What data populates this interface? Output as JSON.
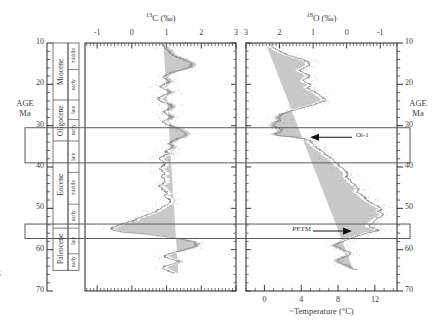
{
  "figure": {
    "kind": "paleoclimate-isotope-stack",
    "left_panel": {
      "title_iso": "13",
      "title_el": "C",
      "title_unit": "(‰)",
      "title_full": "13C (‰)",
      "x_ticks": [
        "-1",
        "0",
        "1",
        "2",
        "3"
      ],
      "x_tick_values": [
        -1,
        0,
        1,
        2,
        3
      ],
      "x_min": -1.35,
      "x_max": 3.0,
      "x_reversed": false
    },
    "right_panel": {
      "title_iso": "18",
      "title_el": "O",
      "title_unit": "(‰)",
      "title_full": "18O (‰)",
      "x_ticks": [
        "3",
        "2",
        "1",
        "0",
        "-1"
      ],
      "x_tick_values": [
        3,
        2,
        1,
        0,
        -1
      ],
      "x_min": 3.0,
      "x_max": -1.5,
      "x_reversed": true,
      "secondary_axis": {
        "label_prefix": "~",
        "label": "Temperature (°C)",
        "label_full": "~Temperature (°C)",
        "ticks": [
          "0",
          "4",
          "8",
          "12"
        ],
        "tick_values": [
          0,
          4,
          8,
          12
        ],
        "min": -2.0,
        "max": 14.4
      }
    },
    "age_axis": {
      "label_line1": "AGE",
      "label_line2": "Ma",
      "ticks": [
        "10",
        "20",
        "30",
        "40",
        "50",
        "60",
        "70"
      ],
      "tick_values": [
        10,
        20,
        30,
        40,
        50,
        60,
        70
      ],
      "minor_step": 2,
      "min": 10,
      "max": 70,
      "left_label_line1": "AGE",
      "left_label_line2": "Ma",
      "right_label_line1": "AGE",
      "right_label_line2": "Ma"
    },
    "epochs": [
      {
        "name": "Miocene",
        "top": 10,
        "bottom": 23.8
      },
      {
        "name": "Oligocene",
        "top": 23.8,
        "bottom": 33.7
      },
      {
        "name": "Eocene",
        "top": 33.7,
        "bottom": 54.8
      },
      {
        "name": "Paleocene",
        "top": 54.8,
        "bottom": 65.0
      }
    ],
    "stages": [
      {
        "name": "middle",
        "top": 10.0,
        "bottom": 16.4
      },
      {
        "name": "early",
        "top": 16.4,
        "bottom": 23.8
      },
      {
        "name": "late",
        "top": 23.8,
        "bottom": 28.5
      },
      {
        "name": "early",
        "top": 28.5,
        "bottom": 33.7
      },
      {
        "name": "late",
        "top": 33.7,
        "bottom": 41.3
      },
      {
        "name": "middle",
        "top": 41.3,
        "bottom": 49.0
      },
      {
        "name": "early",
        "top": 49.0,
        "bottom": 54.8
      },
      {
        "name": "late",
        "top": 54.8,
        "bottom": 61.0
      },
      {
        "name": "early",
        "top": 61.0,
        "bottom": 65.0
      }
    ],
    "highlight_boxes": [
      {
        "name": "oi-1-interval",
        "top": 30.5,
        "bottom": 39.0
      },
      {
        "name": "petm-interval",
        "top": 53.8,
        "bottom": 57.3
      }
    ],
    "annotations": [
      {
        "id": "oi-1",
        "text": "Oi-1",
        "age": 32.8,
        "arrow": "left"
      },
      {
        "id": "petm",
        "text": "PETM",
        "age": 55.5,
        "arrow": "right"
      }
    ],
    "colors": {
      "ink": "#3a3a3a",
      "frame": "#555555",
      "data_line": "#7a7a7a",
      "data_band": "#b4b4b4",
      "highlight_stroke": "#5a5a5a",
      "background": "#ffffff"
    }
  },
  "chart_data": {
    "type": "line",
    "xlabel": "",
    "ylabel": "AGE Ma",
    "ylim": [
      70,
      10
    ],
    "grid": false,
    "legend": "none",
    "panels": [
      {
        "name": "d13C",
        "title": "13C (‰)",
        "xlabel": "13C (‰)",
        "xlim": [
          -1.35,
          3.0
        ],
        "xticks": [
          -1,
          0,
          1,
          2,
          3
        ],
        "x_reversed": false,
        "series": [
          {
            "name": "δ13C smoothed",
            "age": [
              10.0,
              10.6,
              11.2,
              11.8,
              12.4,
              13.0,
              13.6,
              14.2,
              14.8,
              15.4,
              16.0,
              16.5,
              17.0,
              17.6,
              18.2,
              18.8,
              19.4,
              20.0,
              20.6,
              21.2,
              21.8,
              22.4,
              23.0,
              23.6,
              24.2,
              24.8,
              25.4,
              26.0,
              26.6,
              27.2,
              27.8,
              28.4,
              29.0,
              29.6,
              30.2,
              30.8,
              31.4,
              32.0,
              32.6,
              33.2,
              33.8,
              34.4,
              35.0,
              35.6,
              36.2,
              36.8,
              37.4,
              38.0,
              38.6,
              39.2,
              39.8,
              40.4,
              41.0,
              41.6,
              42.2,
              42.8,
              43.4,
              44.0,
              44.6,
              45.2,
              45.8,
              46.4,
              47.0,
              47.6,
              48.2,
              48.8,
              49.4,
              50.0,
              50.6,
              51.2,
              51.8,
              52.4,
              53.0,
              53.4,
              53.8,
              54.2,
              54.6,
              55.0,
              55.4,
              55.8,
              56.2,
              56.8,
              57.4,
              58.0,
              58.6,
              59.2,
              59.8,
              60.4,
              61.0,
              61.6,
              62.2,
              62.8,
              63.4,
              64.0,
              64.6,
              65.2,
              65.8,
              66.2
            ],
            "values": [
              0.8,
              0.88,
              0.95,
              1.05,
              1.1,
              1.18,
              1.35,
              1.55,
              1.7,
              1.72,
              1.6,
              1.42,
              1.18,
              1.0,
              0.92,
              1.0,
              1.08,
              0.92,
              0.8,
              0.95,
              1.12,
              1.0,
              0.82,
              0.72,
              0.88,
              1.05,
              1.18,
              1.05,
              0.9,
              1.0,
              1.15,
              1.05,
              0.88,
              1.0,
              1.18,
              1.35,
              1.48,
              1.55,
              1.48,
              1.3,
              1.15,
              1.05,
              1.2,
              1.1,
              0.95,
              1.08,
              0.9,
              0.78,
              0.88,
              0.98,
              0.88,
              0.78,
              0.88,
              0.95,
              0.85,
              0.9,
              0.98,
              0.88,
              0.8,
              0.88,
              0.95,
              1.02,
              0.95,
              1.05,
              1.12,
              1.05,
              0.95,
              0.85,
              0.72,
              0.55,
              0.35,
              0.18,
              0.05,
              -0.1,
              -0.3,
              -0.45,
              -0.55,
              -0.6,
              -0.5,
              -0.2,
              0.35,
              0.95,
              1.4,
              1.72,
              1.85,
              1.8,
              1.62,
              1.35,
              1.05,
              0.92,
              1.1,
              1.35,
              1.2,
              0.95,
              0.88,
              1.05,
              1.25
            ]
          }
        ]
      },
      {
        "name": "d18O",
        "title": "18O (‰)",
        "xlabel": "18O (‰)",
        "xlim": [
          3.0,
          -1.5
        ],
        "xticks": [
          3,
          2,
          1,
          0,
          -1
        ],
        "x_reversed": true,
        "secondary_xlabel": "~Temperature (°C)",
        "secondary_xticks": [
          0,
          4,
          8,
          12
        ],
        "series": [
          {
            "name": "δ18O smoothed",
            "age": [
              10.0,
              10.6,
              11.2,
              11.8,
              12.4,
              13.0,
              13.6,
              14.2,
              14.8,
              15.4,
              16.0,
              16.6,
              17.2,
              17.8,
              18.4,
              19.0,
              19.6,
              20.2,
              20.8,
              21.4,
              22.0,
              22.6,
              23.2,
              23.8,
              24.4,
              25.0,
              25.6,
              26.2,
              26.8,
              27.4,
              28.0,
              28.6,
              29.2,
              29.8,
              30.4,
              31.0,
              31.6,
              32.0,
              32.4,
              32.8,
              33.2,
              33.6,
              34.0,
              34.6,
              35.2,
              35.8,
              36.4,
              37.0,
              37.6,
              38.2,
              38.8,
              39.4,
              40.0,
              40.6,
              41.2,
              41.8,
              42.4,
              43.0,
              43.6,
              44.2,
              44.8,
              45.4,
              46.0,
              46.6,
              47.2,
              47.8,
              48.4,
              49.0,
              49.6,
              50.2,
              50.8,
              51.4,
              52.0,
              52.6,
              53.2,
              53.8,
              54.2,
              54.6,
              55.0,
              55.3,
              55.6,
              56.0,
              56.6,
              57.2,
              57.8,
              58.4,
              59.0,
              59.6,
              60.2,
              60.8,
              61.4,
              62.0,
              62.6,
              63.2,
              63.8,
              64.4,
              65.0,
              65.6
            ],
            "values": [
              2.3,
              2.25,
              2.15,
              2.05,
              1.9,
              1.7,
              1.45,
              1.25,
              1.12,
              1.1,
              1.25,
              1.4,
              1.28,
              1.1,
              1.15,
              1.3,
              1.2,
              1.05,
              1.18,
              1.05,
              0.92,
              0.8,
              0.72,
              0.62,
              0.8,
              1.0,
              1.25,
              1.55,
              1.8,
              1.95,
              2.05,
              1.95,
              2.1,
              2.2,
              2.1,
              1.95,
              2.0,
              2.15,
              2.05,
              1.55,
              1.25,
              1.1,
              1.05,
              1.0,
              0.92,
              0.8,
              0.72,
              0.62,
              0.52,
              0.42,
              0.35,
              0.25,
              0.18,
              0.1,
              0.02,
              -0.05,
              0.02,
              -0.08,
              -0.15,
              -0.22,
              -0.3,
              -0.38,
              -0.3,
              -0.42,
              -0.5,
              -0.58,
              -0.68,
              -0.82,
              -0.95,
              -1.05,
              -0.95,
              -1.1,
              -1.0,
              -0.88,
              -0.8,
              -0.72,
              -0.65,
              -0.72,
              -0.85,
              -1.0,
              -0.85,
              -0.6,
              -0.35,
              -0.15,
              0.05,
              0.22,
              0.35,
              0.22,
              0.05,
              -0.12,
              -0.05,
              0.15,
              0.3,
              0.18,
              0.0,
              -0.15,
              -0.3
            ]
          }
        ]
      }
    ],
    "annotations": [
      {
        "text": "Oi-1",
        "panel": "d18O",
        "age": 32.8
      },
      {
        "text": "PETM",
        "panel": "d18O",
        "age": 55.5
      }
    ],
    "epoch_column": [
      "Miocene",
      "Oligocene",
      "Eocene",
      "Paleocene"
    ],
    "stage_column": [
      "middle",
      "early",
      "late",
      "early",
      "late",
      "middle",
      "early",
      "late",
      "early"
    ]
  }
}
